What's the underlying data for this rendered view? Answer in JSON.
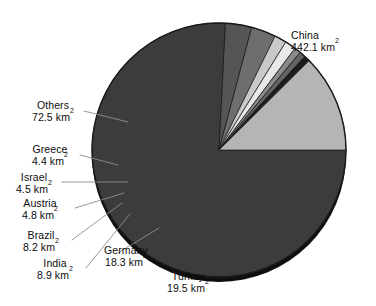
{
  "chart_data": {
    "type": "pie",
    "title": "",
    "unit": "km2",
    "unit_display": "km",
    "unit_superscript": "2",
    "total": 583.2,
    "center": [
      219,
      150
    ],
    "radius": 127,
    "legend": "none",
    "labels_inline": true,
    "categories": [
      "China",
      "Others",
      "Turkey",
      "Germany",
      "India",
      "Brazil",
      "Austria",
      "Israel",
      "Greece"
    ],
    "values": [
      442.1,
      72.5,
      19.5,
      18.3,
      8.9,
      8.2,
      4.8,
      4.5,
      4.4
    ],
    "slices": [
      {
        "name": "China",
        "value": 442.1,
        "value_text": "442.1",
        "color": "#3c3c3c",
        "start_deg": 0.0,
        "end_deg": 272.9
      },
      {
        "name": "Turkey",
        "value": 19.5,
        "value_text": "19.5",
        "color": "#555555",
        "start_deg": 272.9,
        "end_deg": 284.94
      },
      {
        "name": "Germany",
        "value": 18.3,
        "value_text": "18.3",
        "color": "#6e6e6e",
        "start_deg": 284.94,
        "end_deg": 296.23
      },
      {
        "name": "India",
        "value": 8.9,
        "value_text": "8.9",
        "color": "#c9c9c9",
        "start_deg": 296.23,
        "end_deg": 301.73
      },
      {
        "name": "Brazil",
        "value": 8.2,
        "value_text": "8.2",
        "color": "#e8e8e8",
        "start_deg": 301.73,
        "end_deg": 306.79
      },
      {
        "name": "Austria",
        "value": 4.8,
        "value_text": "4.8",
        "color": "#8a8a8a",
        "start_deg": 306.79,
        "end_deg": 309.75
      },
      {
        "name": "Israel",
        "value": 4.5,
        "value_text": "4.5",
        "color": "#646464",
        "start_deg": 309.75,
        "end_deg": 312.53
      },
      {
        "name": "Greece",
        "value": 4.4,
        "value_text": "4.4",
        "color": "#1c1c1c",
        "start_deg": 312.53,
        "end_deg": 315.25
      },
      {
        "name": "Others",
        "value": 72.5,
        "value_text": "72.5",
        "color": "#b5b5b5",
        "start_deg": 315.25,
        "end_deg": 360.0
      }
    ],
    "style": {
      "shadow_color": "#111111",
      "outline_color": "#1a1a1a",
      "leader_color": "#8d8d8d",
      "background": "#ffffff"
    }
  },
  "labels": {
    "china": {
      "name": "China",
      "value": "442.1",
      "unit": "km",
      "sup": "2"
    },
    "others": {
      "name": "Others",
      "value": "72.5",
      "unit": "km",
      "sup": "2"
    },
    "greece": {
      "name": "Greece",
      "value": "4.4",
      "unit": "km",
      "sup": "2"
    },
    "israel": {
      "name": "Israel",
      "value": "4.5",
      "unit": "km",
      "sup": "2"
    },
    "austria": {
      "name": "Austria",
      "value": "4.8",
      "unit": "km",
      "sup": "2"
    },
    "brazil": {
      "name": "Brazil",
      "value": "8.2",
      "unit": "km",
      "sup": "2"
    },
    "india": {
      "name": "India",
      "value": "8.9",
      "unit": "km",
      "sup": "2"
    },
    "germany": {
      "name": "Germany",
      "value": "18.3",
      "unit": "km",
      "sup": "2"
    },
    "turkey": {
      "name": "Turkey",
      "value": "19.5",
      "unit": "km",
      "sup": "2"
    }
  }
}
